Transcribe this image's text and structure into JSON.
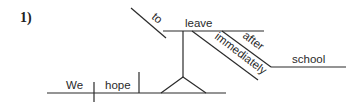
{
  "figure": {
    "number_label": "1)",
    "type": "sentence diagram (Reed-Kellogg)",
    "sentence_words": {
      "subject": "We",
      "verb": "hope",
      "infinitive_marker": "to",
      "infinitive_verb": "leave",
      "adverb": "immediately",
      "preposition": "after",
      "object_of_preposition": "school"
    }
  }
}
